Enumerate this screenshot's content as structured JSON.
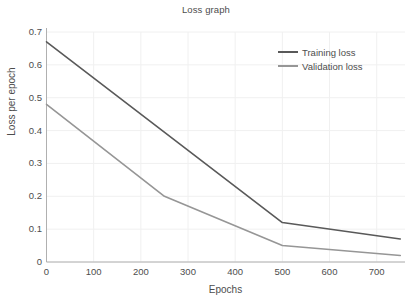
{
  "chart_data": {
    "type": "line",
    "title": "Loss graph",
    "xlabel": "Epochs",
    "ylabel": "Loss per epoch",
    "xlim": [
      0,
      760
    ],
    "ylim": [
      0,
      0.7
    ],
    "xticks": [
      0,
      100,
      200,
      300,
      400,
      500,
      600,
      700
    ],
    "xtick_labels": [
      "0",
      "100",
      "200",
      "300",
      "400",
      "500",
      "600",
      "700"
    ],
    "yticks": [
      0,
      0.1,
      0.2,
      0.3,
      0.4,
      0.5,
      0.6,
      0.7
    ],
    "ytick_labels": [
      "0",
      "0.1",
      "0.2",
      "0.3",
      "0.4",
      "0.5",
      "0.6",
      "0.7"
    ],
    "grid": true,
    "legend_position": "upper right",
    "series": [
      {
        "name": "Training loss",
        "color": "#595959",
        "x": [
          0,
          500,
          750
        ],
        "values": [
          0.67,
          0.12,
          0.07
        ]
      },
      {
        "name": "Validation loss",
        "color": "#969696",
        "x": [
          0,
          250,
          500,
          750
        ],
        "values": [
          0.48,
          0.2,
          0.05,
          0.02
        ]
      }
    ]
  },
  "style": {
    "background": "#ffffff",
    "text_color": "#4d4d4d",
    "grid_color": "#f0f0f0",
    "axis_color": "#b0b0b0"
  }
}
